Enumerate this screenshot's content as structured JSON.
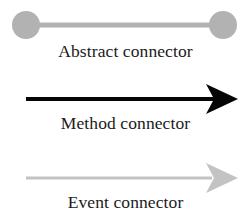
{
  "figure": {
    "kind": "connector-legend",
    "background_color": "#ffffff",
    "width": 251,
    "height": 224
  },
  "legend": {
    "items": [
      {
        "id": "abstract",
        "label": "Abstract connector",
        "glyph": "line-with-round-endpoints",
        "color": "#b2b2b2",
        "line_width": 5,
        "endpoint_radius": 14,
        "has_arrowhead": false
      },
      {
        "id": "method",
        "label": "Method connector",
        "glyph": "arrow-solid-barbed-head",
        "color": "#050505",
        "line_width": 4,
        "endpoint_radius": 0,
        "has_arrowhead": true
      },
      {
        "id": "event",
        "label": "Event connector",
        "glyph": "arrow-light-barbed-head",
        "color": "#c3c3c3",
        "line_width": 3,
        "endpoint_radius": 0,
        "has_arrowhead": true
      }
    ]
  }
}
